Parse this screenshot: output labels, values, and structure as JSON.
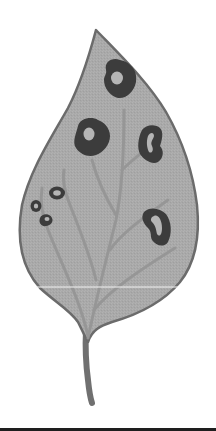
{
  "image": {
    "subject": "Leaf with disease spots illustration",
    "colors": {
      "background": "#ffffff",
      "leaf_fill": "#a9a9a9",
      "leaf_outline": "#6b6b6b",
      "vein": "#959595",
      "spot_ring": "#3c3c3c",
      "spot_center": "#b5b5b5",
      "stem": "#707070",
      "bottom_bar": "#1e1e1e"
    },
    "spots": [
      {
        "name": "top-spot",
        "cx": 120,
        "cy": 80
      },
      {
        "name": "middle-left-spot",
        "cx": 92,
        "cy": 137
      },
      {
        "name": "middle-right-spot",
        "cx": 153,
        "cy": 143
      },
      {
        "name": "lower-right-spot",
        "cx": 157,
        "cy": 226
      },
      {
        "name": "small-spot-1",
        "cx": 56,
        "cy": 194
      },
      {
        "name": "small-spot-2",
        "cx": 36,
        "cy": 205
      },
      {
        "name": "small-spot-3",
        "cx": 46,
        "cy": 221
      }
    ],
    "caption": "Leaf with dark ring-shaped lesions"
  }
}
